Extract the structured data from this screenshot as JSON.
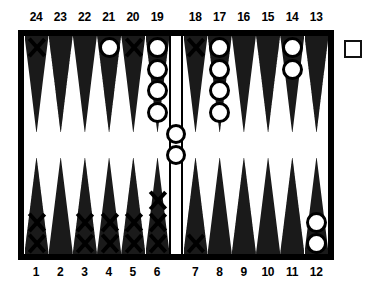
{
  "board": {
    "title": "backgammon-board",
    "colors": {
      "frame": "#000000",
      "field": "#ffffff",
      "point_light": "#ffffff",
      "point_dark": "#9a9a9a",
      "checker_outline": "#000000"
    },
    "top_labels": [
      "24",
      "23",
      "22",
      "21",
      "20",
      "19",
      "18",
      "17",
      "16",
      "15",
      "14",
      "13"
    ],
    "bottom_labels": [
      "1",
      "2",
      "3",
      "4",
      "5",
      "6",
      "7",
      "8",
      "9",
      "10",
      "11",
      "12"
    ],
    "points": [
      {
        "point": "24",
        "row": "top",
        "quadrant": "left",
        "shade": "light",
        "checker": "X",
        "count": 1
      },
      {
        "point": "23",
        "row": "top",
        "quadrant": "left",
        "shade": "dark",
        "checker": "",
        "count": 0
      },
      {
        "point": "22",
        "row": "top",
        "quadrant": "left",
        "shade": "light",
        "checker": "",
        "count": 0
      },
      {
        "point": "21",
        "row": "top",
        "quadrant": "left",
        "shade": "dark",
        "checker": "O",
        "count": 1
      },
      {
        "point": "20",
        "row": "top",
        "quadrant": "left",
        "shade": "light",
        "checker": "X",
        "count": 1
      },
      {
        "point": "19",
        "row": "top",
        "quadrant": "left",
        "shade": "dark",
        "checker": "O",
        "count": 4
      },
      {
        "point": "18",
        "row": "top",
        "quadrant": "right",
        "shade": "light",
        "checker": "X",
        "count": 1
      },
      {
        "point": "17",
        "row": "top",
        "quadrant": "right",
        "shade": "dark",
        "checker": "O",
        "count": 4
      },
      {
        "point": "16",
        "row": "top",
        "quadrant": "right",
        "shade": "light",
        "checker": "",
        "count": 0
      },
      {
        "point": "15",
        "row": "top",
        "quadrant": "right",
        "shade": "dark",
        "checker": "",
        "count": 0
      },
      {
        "point": "14",
        "row": "top",
        "quadrant": "right",
        "shade": "light",
        "checker": "O",
        "count": 2
      },
      {
        "point": "13",
        "row": "top",
        "quadrant": "right",
        "shade": "dark",
        "checker": "",
        "count": 0
      },
      {
        "point": "1",
        "row": "bottom",
        "quadrant": "left",
        "shade": "dark",
        "checker": "X",
        "count": 2
      },
      {
        "point": "2",
        "row": "bottom",
        "quadrant": "left",
        "shade": "light",
        "checker": "",
        "count": 0
      },
      {
        "point": "3",
        "row": "bottom",
        "quadrant": "left",
        "shade": "dark",
        "checker": "X",
        "count": 2
      },
      {
        "point": "4",
        "row": "bottom",
        "quadrant": "left",
        "shade": "light",
        "checker": "X",
        "count": 2
      },
      {
        "point": "5",
        "row": "bottom",
        "quadrant": "left",
        "shade": "dark",
        "checker": "X",
        "count": 2
      },
      {
        "point": "6",
        "row": "bottom",
        "quadrant": "left",
        "shade": "light",
        "checker": "X",
        "count": 3
      },
      {
        "point": "7",
        "row": "bottom",
        "quadrant": "right",
        "shade": "dark",
        "checker": "X",
        "count": 1
      },
      {
        "point": "8",
        "row": "bottom",
        "quadrant": "right",
        "shade": "light",
        "checker": "",
        "count": 0
      },
      {
        "point": "9",
        "row": "bottom",
        "quadrant": "right",
        "shade": "dark",
        "checker": "",
        "count": 0
      },
      {
        "point": "10",
        "row": "bottom",
        "quadrant": "right",
        "shade": "light",
        "checker": "",
        "count": 0
      },
      {
        "point": "11",
        "row": "bottom",
        "quadrant": "right",
        "shade": "dark",
        "checker": "",
        "count": 0
      },
      {
        "point": "12",
        "row": "bottom",
        "quadrant": "right",
        "shade": "light",
        "checker": "O",
        "count": 2
      }
    ],
    "bar": {
      "label": "bar",
      "checker": "O",
      "count": 2
    },
    "doubling_cube": {
      "label": "",
      "value": ""
    }
  }
}
